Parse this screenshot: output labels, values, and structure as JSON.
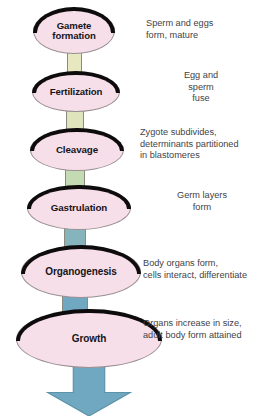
{
  "diagram": {
    "colors": {
      "oval_fill": "#f7dfe9",
      "oval_ring": "#0d0b0c",
      "oval_outline": "#9a8e92",
      "caption_text": "#434246",
      "arrow_fill": "#6fa8c0",
      "background": "#ffffff"
    },
    "stages": [
      {
        "id": "gamete-formation",
        "label": "Gamete\nformation",
        "description": "Sperm and eggs\nform, mature",
        "description_align": "left",
        "oval": {
          "x": 33,
          "y": 8,
          "width": 82,
          "height": 46
        },
        "label_font_size": 9.6,
        "caption": {
          "x": 146,
          "y": 18,
          "width": 118
        }
      },
      {
        "id": "fertilization",
        "label": "Fertilization",
        "description": "Egg and\nsperm\nfuse",
        "description_align": "center",
        "oval": {
          "x": 32,
          "y": 72,
          "width": 88,
          "height": 40
        },
        "label_font_size": 9.6,
        "caption": {
          "x": 146,
          "y": 70,
          "width": 110
        }
      },
      {
        "id": "cleavage",
        "label": "Cleavage",
        "description": "Zygote subdivides,\ndeterminants partitioned\nin blastomeres",
        "description_align": "left",
        "oval": {
          "x": 30,
          "y": 129,
          "width": 94,
          "height": 42
        },
        "label_font_size": 9.8,
        "caption": {
          "x": 140,
          "y": 127,
          "width": 130
        }
      },
      {
        "id": "gastrulation",
        "label": "Gastrulation",
        "description": "Germ layers\nform",
        "description_align": "center",
        "oval": {
          "x": 27,
          "y": 186,
          "width": 104,
          "height": 44
        },
        "label_font_size": 9.8,
        "caption": {
          "x": 146,
          "y": 190,
          "width": 112
        }
      },
      {
        "id": "organogenesis",
        "label": "Organogenesis",
        "description": "Body organs form,\ncells interact, differentiate",
        "description_align": "left",
        "oval": {
          "x": 21,
          "y": 246,
          "width": 120,
          "height": 52
        },
        "label_font_size": 10,
        "caption": {
          "x": 143,
          "y": 258,
          "width": 128
        }
      },
      {
        "id": "growth",
        "label": "Growth",
        "description": "Organs increase in size,\nadult body form attained",
        "description_align": "left",
        "oval": {
          "x": 16,
          "y": 310,
          "width": 146,
          "height": 58
        },
        "label_font_size": 10,
        "caption": {
          "x": 143,
          "y": 318,
          "width": 128
        }
      }
    ],
    "connectors": [
      {
        "id": "connector-gamete-to-fertilization",
        "color": "#e8e8c0",
        "x": 67,
        "y": 52,
        "width": 15,
        "height": 22
      },
      {
        "id": "connector-fertilization-to-cleavage",
        "color": "#dfe4bc",
        "x": 66,
        "y": 110,
        "width": 18,
        "height": 21
      },
      {
        "id": "connector-cleavage-to-gastrulation",
        "color": "#c3dab2",
        "x": 65,
        "y": 169,
        "width": 20,
        "height": 19
      },
      {
        "id": "connector-gastrulation-to-organogenesis",
        "color": "#86b4bc",
        "x": 64,
        "y": 228,
        "width": 22,
        "height": 20
      },
      {
        "id": "connector-organogenesis-to-growth",
        "color": "#6fa8c0",
        "x": 62,
        "y": 296,
        "width": 26,
        "height": 16
      }
    ],
    "arrow": {
      "id": "growth-outcome-arrow",
      "color": "#6fa8c0",
      "x": 40,
      "y": 360,
      "width": 98,
      "height": 56
    }
  }
}
